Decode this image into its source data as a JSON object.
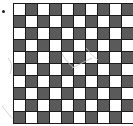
{
  "figure": {
    "type": "checkerboard-grid",
    "rows": 10,
    "columns": 10,
    "top_left_color": "light",
    "colors": {
      "light": "#ffffff",
      "dark": "#5a5a5a",
      "grid_line": "#1a1a1a"
    }
  },
  "marker": {
    "label": "bullet-dot"
  }
}
